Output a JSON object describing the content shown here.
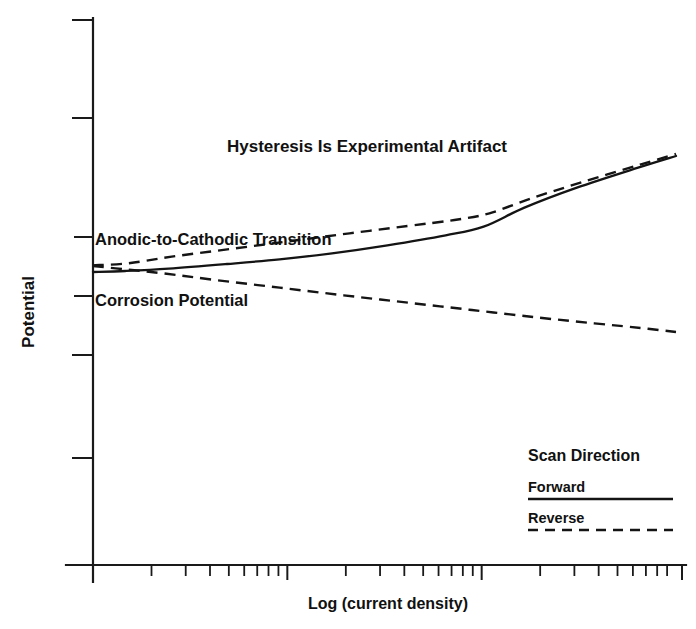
{
  "chart_data": {
    "type": "line",
    "title": "Hysteresis Is Experimental Artifact",
    "xlabel": "Log (current density)",
    "ylabel": "Potential",
    "grid": false,
    "legend_position": "bottom-right",
    "legend_title": "Scan Direction",
    "xlim": [
      0,
      10
    ],
    "ylim": [
      0,
      10
    ],
    "x_axis_scale": "log",
    "x_tick_labels": [],
    "y_tick_labels": [],
    "annotations": [
      {
        "text": "Anodic-to-Cathodic Transition",
        "x": 0.25,
        "y": 6.05
      },
      {
        "text": "Corrosion Potential",
        "x": 0.25,
        "y": 5.0
      }
    ],
    "series": [
      {
        "name": "Forward",
        "style": "solid",
        "points": [
          [
            0.0,
            5.42
          ],
          [
            0.55,
            5.45
          ],
          [
            1.3,
            5.52
          ],
          [
            2.3,
            5.66
          ],
          [
            3.2,
            5.8
          ],
          [
            4.1,
            5.98
          ],
          [
            5.05,
            6.22
          ],
          [
            6.05,
            6.52
          ],
          [
            6.7,
            6.78
          ],
          [
            7.4,
            7.35
          ],
          [
            8.3,
            7.95
          ],
          [
            9.35,
            8.55
          ],
          [
            10.0,
            8.9
          ]
        ]
      },
      {
        "name": "Reverse",
        "style": "dashed",
        "branch": "upper",
        "points": [
          [
            0.0,
            5.62
          ],
          [
            0.6,
            5.68
          ],
          [
            1.35,
            5.88
          ],
          [
            2.4,
            6.12
          ],
          [
            3.4,
            6.35
          ],
          [
            4.4,
            6.58
          ],
          [
            5.4,
            6.8
          ],
          [
            6.2,
            6.98
          ],
          [
            6.8,
            7.18
          ],
          [
            7.5,
            7.62
          ],
          [
            8.4,
            8.12
          ],
          [
            9.4,
            8.65
          ],
          [
            10.0,
            8.96
          ]
        ]
      },
      {
        "name": "Reverse",
        "style": "dashed",
        "branch": "lower",
        "points": [
          [
            0.0,
            5.6
          ],
          [
            0.55,
            5.5
          ],
          [
            1.2,
            5.38
          ],
          [
            2.1,
            5.18
          ],
          [
            3.2,
            4.95
          ],
          [
            4.3,
            4.72
          ],
          [
            5.4,
            4.5
          ],
          [
            6.5,
            4.28
          ],
          [
            7.6,
            4.06
          ],
          [
            8.6,
            3.88
          ],
          [
            9.4,
            3.74
          ],
          [
            10.0,
            3.62
          ]
        ]
      }
    ]
  },
  "legend": {
    "heading": "Scan Direction",
    "items": [
      {
        "label": "Forward",
        "style": "solid"
      },
      {
        "label": "Reverse",
        "style": "dashed"
      }
    ]
  },
  "axes": {
    "x_title": "Log (current density)",
    "y_title": "Potential"
  },
  "title": "Hysteresis Is Experimental Artifact",
  "annotations": {
    "transition": "Anodic-to-Cathodic Transition",
    "corrosion": "Corrosion Potential"
  }
}
